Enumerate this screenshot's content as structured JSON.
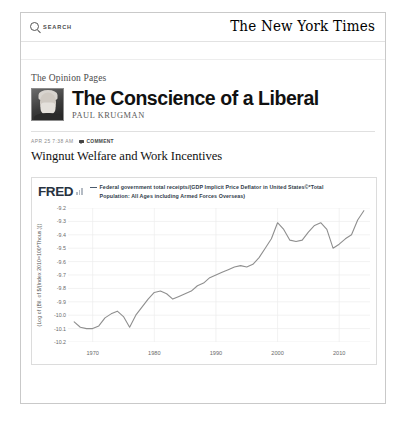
{
  "masthead": {
    "search_label": "SEARCH",
    "search_icon": "search-icon",
    "brand": "The New York Times"
  },
  "blog": {
    "kicker": "The Opinion Pages",
    "title": "The Conscience of a Liberal",
    "author": "PAUL KRUGMAN",
    "avatar_alt": "Paul Krugman portrait"
  },
  "post": {
    "date": "APR 25 7:38 AM",
    "comment_label": "Comment",
    "comment_icon": "comment-bubble-icon",
    "title": "Wingnut Welfare and Work Incentives"
  },
  "fred": {
    "logo": "FRED",
    "logo_icon": "bar-chart-icon",
    "legend_line1": "Federal government total receipts/(GDP Implicit Price Deflator in United",
    "legend_line2": "States©*Total Population: All Ages including Armed Forces Overseas)",
    "line_color": "#8f8f8f",
    "accent_color": "#27323f"
  },
  "chart_data": {
    "type": "line",
    "title": "Federal government total receipts/(GDP Implicit Price Deflator in United States©*Total Population: All Ages including Armed Forces Overseas)",
    "xlabel": "",
    "ylabel": "(Log of (Bil. of $/(Index 2010=100*Thous.)))",
    "xlim": [
      1966,
      2015
    ],
    "ylim": [
      -10.2,
      -9.2
    ],
    "xticks": [
      1970,
      1980,
      1990,
      2000,
      2010
    ],
    "yticks": [
      -9.2,
      -9.3,
      -9.4,
      -9.5,
      -9.6,
      -9.7,
      -9.8,
      -9.9,
      -10.0,
      -10.1,
      -10.2
    ],
    "grid": true,
    "legend_position": "top",
    "series": [
      {
        "name": "Federal government total receipts/(GDP Implicit Price Deflator in United States©*Total Population: All Ages including Armed Forces Overseas)",
        "color": "#8f8f8f",
        "x": [
          1967,
          1968,
          1969,
          1970,
          1971,
          1972,
          1973,
          1974,
          1975,
          1976,
          1977,
          1978,
          1979,
          1980,
          1981,
          1982,
          1983,
          1984,
          1985,
          1986,
          1987,
          1988,
          1989,
          1990,
          1991,
          1992,
          1993,
          1994,
          1995,
          1996,
          1997,
          1998,
          1999,
          2000,
          2001,
          2002,
          2003,
          2004,
          2005,
          2006,
          2007,
          2008,
          2009,
          2010,
          2011,
          2012,
          2013,
          2014
        ],
        "y": [
          -10.05,
          -10.09,
          -10.1,
          -10.1,
          -10.08,
          -10.02,
          -9.99,
          -9.97,
          -10.01,
          -10.09,
          -10.0,
          -9.94,
          -9.88,
          -9.83,
          -9.82,
          -9.84,
          -9.88,
          -9.86,
          -9.84,
          -9.82,
          -9.78,
          -9.76,
          -9.72,
          -9.7,
          -9.68,
          -9.66,
          -9.64,
          -9.63,
          -9.64,
          -9.62,
          -9.57,
          -9.5,
          -9.43,
          -9.31,
          -9.36,
          -9.44,
          -9.45,
          -9.44,
          -9.38,
          -9.33,
          -9.31,
          -9.36,
          -9.5,
          -9.47,
          -9.43,
          -9.4,
          -9.29,
          -9.22
        ]
      }
    ]
  }
}
